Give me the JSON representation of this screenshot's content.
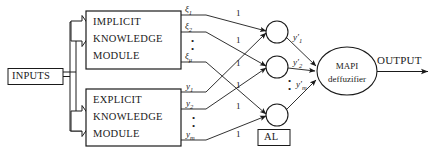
{
  "diagram": {
    "colors": {
      "stroke": "#1a1a1a",
      "background": "#ffffff",
      "text": "#1a1a1a"
    },
    "inputs_block": {
      "label": "INPUTS"
    },
    "modules": [
      {
        "id": "implicit",
        "line1": "IMPLICIT",
        "line2": "KNOWLEDGE",
        "line3": "MODULE"
      },
      {
        "id": "explicit",
        "line1": "EXPLICIT",
        "line2": "KNOWLEDGE",
        "line3": "MODULE"
      }
    ],
    "implicit_outputs": [
      {
        "base": "ξ",
        "sub": "1"
      },
      {
        "base": "ξ",
        "sub": "2"
      },
      {
        "base": "ξ",
        "sub": "μ"
      }
    ],
    "implicit_dots": "•",
    "explicit_outputs": [
      {
        "base": "y",
        "sub": "1"
      },
      {
        "base": "y",
        "sub": "2"
      },
      {
        "base": "y",
        "sub": "m"
      }
    ],
    "explicit_dots": "•",
    "weights": [
      "1",
      "1",
      "1",
      "1",
      "1",
      "1"
    ],
    "neuron_outputs": [
      {
        "base": "y′",
        "sub": "1"
      },
      {
        "base": "y′",
        "sub": "2"
      },
      {
        "base": "y′",
        "sub": "m"
      }
    ],
    "neuron_layer_label": "AL",
    "defuzzifier": {
      "line1": "MAPI",
      "line2": "deffuzifier"
    },
    "output_label": "OUTPUT"
  }
}
